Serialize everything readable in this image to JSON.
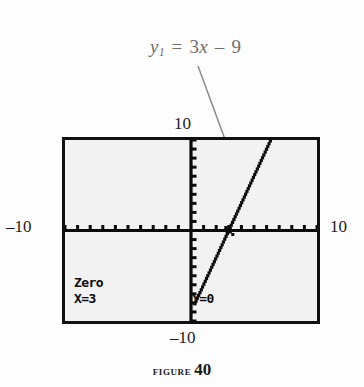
{
  "figure": {
    "caption_word": "Figure",
    "caption_number": "40"
  },
  "equation": {
    "lhs_var": "y",
    "lhs_sub": "1",
    "equals": "=",
    "coefficient": "3",
    "variable": "x",
    "operator": "–",
    "constant": "9",
    "full_text": "y1 = 3x – 9",
    "color": "#6e6e6e"
  },
  "axis_annotations": {
    "y_max": "10",
    "y_min": "–10",
    "x_min": "–10",
    "x_max": "10"
  },
  "calculator": {
    "readout_title": "Zero",
    "readout_x": "X=3",
    "readout_y": "Y=0",
    "screen_bg": "#f2f2f2",
    "border_color": "#111111"
  },
  "chart_data": {
    "type": "line",
    "title": "",
    "xlabel": "",
    "ylabel": "",
    "xlim": [
      -10,
      10
    ],
    "ylim": [
      -10,
      10
    ],
    "xtick_step": 1,
    "ytick_step": 1,
    "grid": false,
    "legend": "none",
    "series": [
      {
        "name": "y1 = 3x - 9",
        "slope": 3,
        "intercept": -9,
        "style": "dotted",
        "x": [
          0.3,
          6.3
        ],
        "y": [
          -8.1,
          9.9
        ]
      }
    ],
    "annotations": [
      {
        "name": "zero-cursor",
        "x": 3,
        "y": 0,
        "label": "Zero X=3 Y=0"
      }
    ]
  }
}
